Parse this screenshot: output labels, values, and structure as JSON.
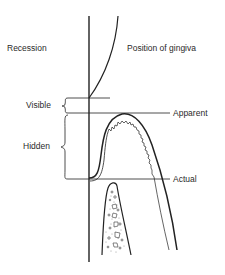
{
  "figure": {
    "title_left": "Recession",
    "title_right": "Position of gingiva",
    "recession_labels": {
      "visible": "Visible",
      "hidden": "Hidden"
    },
    "gingiva_labels": {
      "apparent": "Apparent",
      "actual": "Actual"
    },
    "structures": [
      "tooth-root-surface",
      "gingival-margin-curve",
      "gingival-tissue",
      "alveolar-bone"
    ],
    "colors": {
      "line": "#222222",
      "text": "#2a2a2a",
      "background": "#ffffff"
    }
  }
}
